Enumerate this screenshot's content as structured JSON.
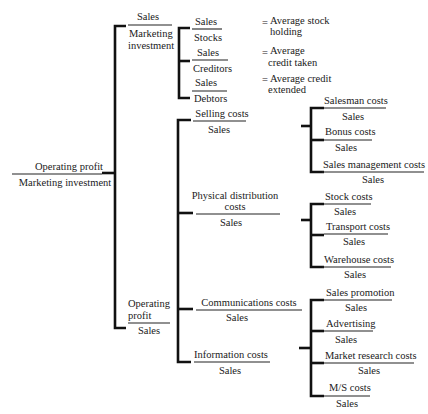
{
  "root": {
    "numerator": "Operating profit",
    "denominator": "Marketing investment"
  },
  "level1": [
    {
      "id": "mi",
      "numerator": "Sales",
      "denominator_lines": [
        "Marketing",
        "investment"
      ]
    },
    {
      "id": "op",
      "numerator_lines": [
        "Operating",
        "profit"
      ],
      "denominator": "Sales"
    }
  ],
  "asset_ratios": [
    {
      "numerator": "Sales",
      "denominator": "Stocks",
      "equals": "=",
      "meaning_lines": [
        "Average stock",
        "holding"
      ]
    },
    {
      "numerator": "Sales",
      "denominator": "Creditors",
      "equals": "=",
      "meaning_lines": [
        "Average",
        "credit taken"
      ]
    },
    {
      "numerator": "Sales",
      "denominator": "Debtors",
      "equals": "=",
      "meaning_lines": [
        "Average credit",
        "extended"
      ]
    }
  ],
  "cost_ratios": [
    {
      "numerator_lines": [
        "Selling costs"
      ],
      "denominator": "Sales",
      "children": [
        {
          "numerator": "Salesman costs",
          "denominator": "Sales"
        },
        {
          "numerator": "Bonus costs",
          "denominator": "Sales"
        },
        {
          "numerator": "Sales management costs",
          "denominator": "Sales"
        }
      ]
    },
    {
      "numerator_lines": [
        "Physical distribution",
        "costs"
      ],
      "denominator": "Sales",
      "children": [
        {
          "numerator": "Stock costs",
          "denominator": "Sales"
        },
        {
          "numerator": "Transport costs",
          "denominator": "Sales"
        },
        {
          "numerator": "Warehouse costs",
          "denominator": "Sales"
        }
      ]
    },
    {
      "numerator_lines": [
        "Communications costs"
      ],
      "denominator": "Sales",
      "children": [
        {
          "numerator": "Sales promotion",
          "denominator": "Sales"
        },
        {
          "numerator": "Advertising",
          "denominator": "Sales"
        },
        {
          "numerator": "Market research costs",
          "denominator": "Sales"
        },
        {
          "numerator": "M/S costs",
          "denominator": "Sales"
        }
      ]
    },
    {
      "numerator_lines": [
        "Information costs"
      ],
      "denominator": "Sales",
      "children": []
    }
  ]
}
